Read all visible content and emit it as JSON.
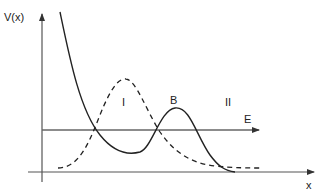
{
  "diagram": {
    "y_axis_label": "V(x)",
    "x_axis_label": "x",
    "energy_label": "E",
    "region_labels": [
      "I",
      "II"
    ],
    "barrier_label": "B",
    "colors": {
      "axis": "#555555",
      "curve": "#222222",
      "energy_line": "#666666",
      "dashed_curve": "#222222"
    },
    "curves": [
      {
        "name": "potential V(x)",
        "style": "solid"
      },
      {
        "name": "wavefunction / probability",
        "style": "dashed"
      }
    ]
  }
}
